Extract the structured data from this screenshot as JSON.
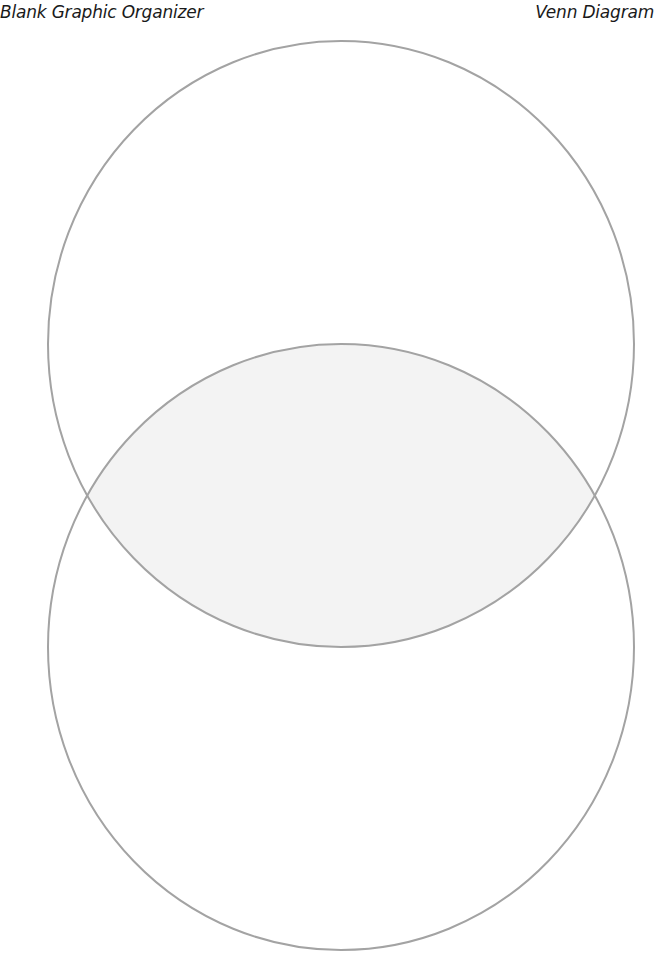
{
  "header": {
    "left_title": "Blank Graphic Organizer",
    "right_title": "Venn Diagram"
  },
  "diagram": {
    "type": "venn",
    "orientation": "vertical",
    "sets": [
      {
        "name": "top-circle",
        "label": ""
      },
      {
        "name": "bottom-circle",
        "label": ""
      }
    ],
    "overlap_label": ""
  },
  "colors": {
    "stroke": "#a3a3a3",
    "overlap_fill": "#f3f3f3",
    "background": "#ffffff",
    "text": "#1a1a1a"
  }
}
